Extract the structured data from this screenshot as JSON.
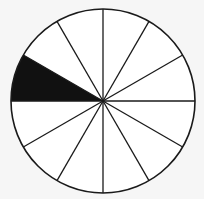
{
  "diagram": {
    "type": "fraction-circle",
    "total_sectors": 12,
    "shaded_sectors": 1,
    "shaded_fraction": "1/12",
    "shaded_sector_angles_deg": [
      150,
      180
    ],
    "colors": {
      "background": "#f6f6f6",
      "fill": "#ffffff",
      "stroke": "#1a1a1a",
      "shaded": "#111111"
    }
  }
}
